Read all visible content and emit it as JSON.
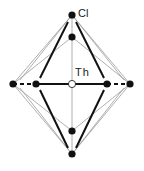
{
  "diagram": {
    "labels": {
      "cl": "Cl",
      "th": "Th"
    },
    "colors": {
      "atom": "#111111",
      "center_fill": "#ffffff",
      "bond_bold": "#111111",
      "bond_thin": "#999999"
    },
    "atoms": [
      {
        "id": "cl-top-outer",
        "x": 72,
        "y": 15
      },
      {
        "id": "cl-top-inner",
        "x": 72,
        "y": 37
      },
      {
        "id": "cl-left-outer",
        "x": 13,
        "y": 84
      },
      {
        "id": "cl-left-inner",
        "x": 36,
        "y": 84
      },
      {
        "id": "th-center",
        "x": 72,
        "y": 84
      },
      {
        "id": "cl-right-inner",
        "x": 107,
        "y": 84
      },
      {
        "id": "cl-right-outer",
        "x": 130,
        "y": 84
      },
      {
        "id": "cl-bottom-inner",
        "x": 72,
        "y": 131
      },
      {
        "id": "cl-bottom-outer",
        "x": 72,
        "y": 154
      }
    ]
  }
}
